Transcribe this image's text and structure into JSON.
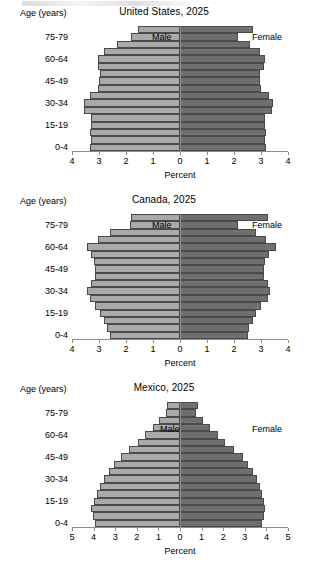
{
  "common": {
    "y_axis_title": "Age (years)",
    "x_axis_title": "Percent",
    "male_label": "Male",
    "female_label": "Female",
    "male_color": "#a9a9a9",
    "female_color": "#6f6f6f",
    "axis_color": "#8d8d8d",
    "age_groups": [
      "0-4",
      "5-9",
      "10-14",
      "15-19",
      "20-24",
      "25-29",
      "30-34",
      "35-39",
      "40-44",
      "45-49",
      "50-54",
      "55-59",
      "60-64",
      "65-69",
      "70-74",
      "75-79",
      "80+"
    ],
    "visible_age_ticks": [
      "0-4",
      "15-19",
      "30-34",
      "45-49",
      "60-64",
      "75-79"
    ]
  },
  "chart_data": [
    {
      "type": "bar",
      "subtype": "population-pyramid",
      "title": "United States, 2025",
      "xlabel": "Percent",
      "ylabel": "Age (years)",
      "xlim": [
        -4,
        4
      ],
      "xticks": [
        4,
        3,
        2,
        1,
        0,
        1,
        2,
        3,
        4
      ],
      "grid": false,
      "legend": [
        "Male",
        "Female"
      ],
      "legend_position": "inside-left-right",
      "categories": [
        "0-4",
        "5-9",
        "10-14",
        "15-19",
        "20-24",
        "25-29",
        "30-34",
        "35-39",
        "40-44",
        "45-49",
        "50-54",
        "55-59",
        "60-64",
        "65-69",
        "70-74",
        "75-79",
        "80+"
      ],
      "series": [
        {
          "name": "Male",
          "values": [
            3.35,
            3.3,
            3.35,
            3.3,
            3.3,
            3.55,
            3.55,
            3.35,
            3.05,
            3.0,
            2.95,
            3.05,
            3.05,
            2.8,
            2.35,
            1.8,
            1.55
          ]
        },
        {
          "name": "Female",
          "values": [
            3.2,
            3.15,
            3.2,
            3.15,
            3.15,
            3.4,
            3.45,
            3.3,
            3.0,
            2.95,
            2.95,
            3.1,
            3.15,
            2.95,
            2.6,
            2.15,
            2.7
          ]
        }
      ]
    },
    {
      "type": "bar",
      "subtype": "population-pyramid",
      "title": "Canada, 2025",
      "xlabel": "Percent",
      "ylabel": "Age (years)",
      "xlim": [
        -4,
        4
      ],
      "xticks": [
        4,
        3,
        2,
        1,
        0,
        1,
        2,
        3,
        4
      ],
      "grid": false,
      "legend": [
        "Male",
        "Female"
      ],
      "legend_position": "inside-left-right",
      "categories": [
        "0-4",
        "5-9",
        "10-14",
        "15-19",
        "20-24",
        "25-29",
        "30-34",
        "35-39",
        "40-44",
        "45-49",
        "50-54",
        "55-59",
        "60-64",
        "65-69",
        "70-74",
        "75-79",
        "80+"
      ],
      "series": [
        {
          "name": "Male",
          "values": [
            2.6,
            2.7,
            2.8,
            2.95,
            3.15,
            3.35,
            3.45,
            3.3,
            3.15,
            3.15,
            3.2,
            3.3,
            3.45,
            3.05,
            2.6,
            1.85,
            1.8
          ]
        },
        {
          "name": "Female",
          "values": [
            2.5,
            2.55,
            2.7,
            2.8,
            3.0,
            3.25,
            3.35,
            3.25,
            3.1,
            3.1,
            3.15,
            3.3,
            3.55,
            3.2,
            2.8,
            2.15,
            3.25
          ]
        }
      ]
    },
    {
      "type": "bar",
      "subtype": "population-pyramid",
      "title": "Mexico, 2025",
      "xlabel": "Percent",
      "ylabel": "Age (years)",
      "xlim": [
        -5,
        5
      ],
      "xticks": [
        5,
        4,
        3,
        2,
        1,
        0,
        1,
        2,
        3,
        4,
        5
      ],
      "grid": false,
      "legend": [
        "Male",
        "Female"
      ],
      "legend_position": "inside-left-right",
      "categories": [
        "0-4",
        "5-9",
        "10-14",
        "15-19",
        "20-24",
        "25-29",
        "30-34",
        "35-39",
        "40-44",
        "45-49",
        "50-54",
        "55-59",
        "60-64",
        "65-69",
        "70-74",
        "75-79",
        "80+"
      ],
      "series": [
        {
          "name": "Male",
          "values": [
            3.95,
            4.05,
            4.1,
            4.0,
            3.85,
            3.7,
            3.5,
            3.3,
            3.05,
            2.75,
            2.35,
            1.95,
            1.6,
            1.25,
            0.95,
            0.65,
            0.6
          ]
        },
        {
          "name": "Female",
          "values": [
            3.8,
            3.9,
            3.95,
            3.9,
            3.8,
            3.7,
            3.55,
            3.4,
            3.15,
            2.9,
            2.5,
            2.1,
            1.75,
            1.4,
            1.05,
            0.75,
            0.85
          ]
        }
      ]
    }
  ]
}
